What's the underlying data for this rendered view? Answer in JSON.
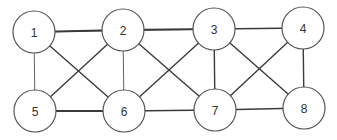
{
  "diagram": {
    "type": "undirected-graph",
    "colors": {
      "background": "#ffffff",
      "edge": "#3a3a3a",
      "node_stroke": "#555555",
      "node_fill": "#ffffff",
      "label": "#333333"
    },
    "node_radius": 21,
    "nodes": [
      {
        "id": "1",
        "label": "1",
        "x": 34,
        "y": 32
      },
      {
        "id": "2",
        "label": "2",
        "x": 123,
        "y": 30
      },
      {
        "id": "3",
        "label": "3",
        "x": 214,
        "y": 29
      },
      {
        "id": "4",
        "label": "4",
        "x": 303,
        "y": 28
      },
      {
        "id": "5",
        "label": "5",
        "x": 35,
        "y": 111
      },
      {
        "id": "6",
        "label": "6",
        "x": 124,
        "y": 111
      },
      {
        "id": "7",
        "label": "7",
        "x": 215,
        "y": 110
      },
      {
        "id": "8",
        "label": "8",
        "x": 304,
        "y": 108
      }
    ],
    "edges": [
      {
        "from": "1",
        "to": "2",
        "weight": "thick"
      },
      {
        "from": "1",
        "to": "3",
        "weight": "thin"
      },
      {
        "from": "1",
        "to": "5",
        "weight": "thin"
      },
      {
        "from": "1",
        "to": "6",
        "weight": "normal"
      },
      {
        "from": "2",
        "to": "3",
        "weight": "thick"
      },
      {
        "from": "2",
        "to": "5",
        "weight": "normal"
      },
      {
        "from": "2",
        "to": "6",
        "weight": "thin"
      },
      {
        "from": "2",
        "to": "7",
        "weight": "normal"
      },
      {
        "from": "3",
        "to": "4",
        "weight": "normal"
      },
      {
        "from": "3",
        "to": "6",
        "weight": "normal"
      },
      {
        "from": "3",
        "to": "7",
        "weight": "normal"
      },
      {
        "from": "3",
        "to": "8",
        "weight": "normal"
      },
      {
        "from": "4",
        "to": "7",
        "weight": "normal"
      },
      {
        "from": "4",
        "to": "8",
        "weight": "normal"
      },
      {
        "from": "5",
        "to": "6",
        "weight": "thick"
      },
      {
        "from": "6",
        "to": "7",
        "weight": "normal"
      },
      {
        "from": "7",
        "to": "8",
        "weight": "normal"
      }
    ]
  }
}
